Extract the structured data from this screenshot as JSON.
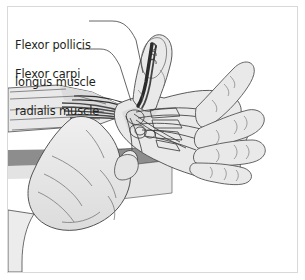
{
  "figure": {
    "domain_kind": "anatomical-illustration",
    "style": "grayscale line drawing",
    "frame_color": "#d9d9d9",
    "background_color": "#ffffff"
  },
  "labels": [
    {
      "id": "flexor-pollicis-longus",
      "line1": "Flexor pollicis",
      "line2": "longus muscle",
      "full_text": "Flexor pollicis longus muscle",
      "leader": {
        "from_x": 89,
        "from_y": 21,
        "to_x": 143,
        "to_y": 73
      }
    },
    {
      "id": "flexor-carpi-radialis",
      "line1": "Flexor carpi",
      "line2": "radialis muscle",
      "full_text": "Flexor carpi radialis muscle",
      "leader": {
        "from_x": 78,
        "from_y": 49,
        "to_x": 131,
        "to_y": 101
      }
    }
  ],
  "colors": {
    "outline": "#3f3f3f",
    "skin_fill": "#e9e9e9",
    "skin_fill_shadow": "#d8d8d8",
    "muscle_dark": "#4a4a4a",
    "tendon_dark": "#2e2e2e",
    "block_top": "#8d8d8d",
    "block_face": "#d3d3d3",
    "block_side": "#ededed",
    "table_band": "#8d8d8d",
    "text": "#231f20"
  },
  "structures": [
    "forearm with flexor muscle striations",
    "thumb with flexor pollicis longus tendon",
    "palm with metacarpal bones and flexor tendons",
    "four extended fingers",
    "examiner hand gripping wrist",
    "examination table block"
  ]
}
